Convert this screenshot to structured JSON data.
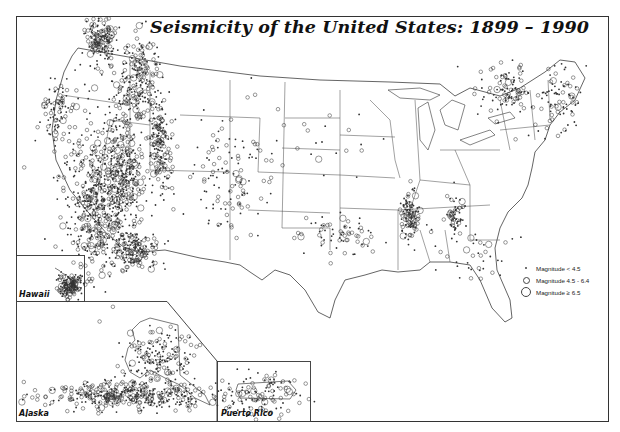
{
  "title": "Seismicity of the United States: 1899 – 1990",
  "legend": {
    "items": [
      {
        "symbol": "small-dot",
        "label": "Magnitude < 4.5"
      },
      {
        "symbol": "medium-circle",
        "label": "Magnitude 4.5 - 6.4"
      },
      {
        "symbol": "large-circle",
        "label": "Magnitude ≥ 6.5"
      }
    ]
  },
  "insets": {
    "hawaii": {
      "label": "Hawaii"
    },
    "alaska": {
      "label": "Alaska"
    },
    "puerto_rico": {
      "label": "Puerto Rico"
    }
  },
  "colors": {
    "ink": "#1a1a1a",
    "background": "#ffffff",
    "frame": "#333333"
  },
  "clusters": [
    {
      "name": "pacific-northwest-puget",
      "cx": 100,
      "cy": 40,
      "rx": 14,
      "ry": 22,
      "density": 160
    },
    {
      "name": "west-coast-california",
      "cx": 95,
      "cy": 200,
      "rx": 32,
      "ry": 70,
      "density": 520
    },
    {
      "name": "nevada-basin",
      "cx": 125,
      "cy": 170,
      "rx": 18,
      "ry": 55,
      "density": 260
    },
    {
      "name": "idaho-montana",
      "cx": 140,
      "cy": 80,
      "rx": 20,
      "ry": 40,
      "density": 220
    },
    {
      "name": "intermountain-utah",
      "cx": 160,
      "cy": 145,
      "rx": 10,
      "ry": 45,
      "density": 170
    },
    {
      "name": "oregon-coast",
      "cx": 58,
      "cy": 110,
      "rx": 14,
      "ry": 30,
      "density": 90
    },
    {
      "name": "southern-california",
      "cx": 135,
      "cy": 250,
      "rx": 22,
      "ry": 20,
      "density": 160
    },
    {
      "name": "new-madrid",
      "cx": 410,
      "cy": 215,
      "rx": 8,
      "ry": 22,
      "density": 110
    },
    {
      "name": "eastern-tennessee",
      "cx": 455,
      "cy": 215,
      "rx": 8,
      "ry": 20,
      "density": 60
    },
    {
      "name": "northeast-quebec",
      "cx": 510,
      "cy": 90,
      "rx": 28,
      "ry": 25,
      "density": 110
    },
    {
      "name": "new-england",
      "cx": 560,
      "cy": 100,
      "rx": 20,
      "ry": 30,
      "density": 80
    },
    {
      "name": "rocky-mountains",
      "cx": 230,
      "cy": 180,
      "rx": 35,
      "ry": 60,
      "density": 120
    },
    {
      "name": "oklahoma-texas",
      "cx": 340,
      "cy": 235,
      "rx": 35,
      "ry": 20,
      "density": 70
    },
    {
      "name": "great-plains",
      "cx": 320,
      "cy": 140,
      "rx": 60,
      "ry": 40,
      "density": 25
    },
    {
      "name": "southeast",
      "cx": 470,
      "cy": 260,
      "rx": 40,
      "ry": 30,
      "density": 40
    },
    {
      "name": "hawaii-big-island",
      "cx": 70,
      "cy": 285,
      "rx": 12,
      "ry": 10,
      "density": 140
    },
    {
      "name": "alaska-aleutians",
      "cx": 130,
      "cy": 395,
      "rx": 80,
      "ry": 12,
      "density": 420
    },
    {
      "name": "alaska-interior",
      "cx": 160,
      "cy": 355,
      "rx": 30,
      "ry": 25,
      "density": 160
    },
    {
      "name": "puerto-rico",
      "cx": 263,
      "cy": 395,
      "rx": 35,
      "ry": 20,
      "density": 110
    }
  ]
}
